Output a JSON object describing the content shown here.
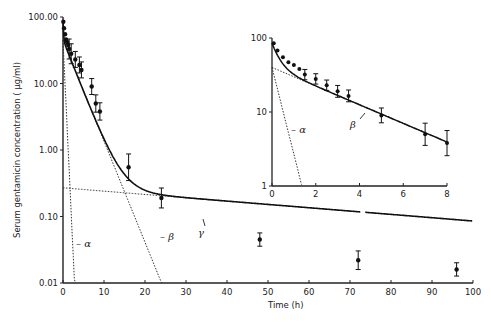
{
  "chart_data": [
    {
      "id": "main",
      "type": "scatter",
      "title": "",
      "xlabel": "Time (h)",
      "ylabel": "Serum gentamicin concentration (µg/ml)",
      "xlim": [
        0,
        100
      ],
      "ylim": [
        0.01,
        100
      ],
      "yscale": "log",
      "xticks": [
        0,
        10,
        20,
        30,
        40,
        50,
        60,
        70,
        80,
        90,
        100
      ],
      "yticks": [
        {
          "v": 100,
          "label": "100.00"
        },
        {
          "v": 10,
          "label": "10.00"
        },
        {
          "v": 1,
          "label": "1.00"
        },
        {
          "v": 0.1,
          "label": "0.10"
        },
        {
          "v": 0.01,
          "label": "0.01"
        }
      ],
      "points": [
        {
          "x": 0.08,
          "y": 85,
          "err": 0
        },
        {
          "x": 0.25,
          "y": 68,
          "err": 0
        },
        {
          "x": 0.5,
          "y": 55,
          "err": 0
        },
        {
          "x": 0.75,
          "y": 46,
          "err": 0
        },
        {
          "x": 1.0,
          "y": 42,
          "err": 0
        },
        {
          "x": 1.25,
          "y": 38,
          "err": 0
        },
        {
          "x": 1.5,
          "y": 33,
          "err": 0.15
        },
        {
          "x": 2.0,
          "y": 28,
          "err": 0.15
        },
        {
          "x": 3.0,
          "y": 23,
          "err": 0.12
        },
        {
          "x": 4.0,
          "y": 19,
          "err": 0.12
        },
        {
          "x": 4.5,
          "y": 16,
          "err": 0.12
        },
        {
          "x": 7.0,
          "y": 9.0,
          "err": 0.12
        },
        {
          "x": 8.0,
          "y": 5.0,
          "err": 0.13
        },
        {
          "x": 9.0,
          "y": 3.8,
          "err": 0.13
        },
        {
          "x": 16,
          "y": 0.55,
          "err": 0.2
        },
        {
          "x": 24,
          "y": 0.19,
          "err": 0.15
        },
        {
          "x": 48,
          "y": 0.045,
          "err": 0.1
        },
        {
          "x": 72,
          "y": 0.022,
          "err": 0.14
        },
        {
          "x": 96,
          "y": 0.016,
          "err": 0.1
        }
      ],
      "fit_curve": {
        "A": 45,
        "alpha": 8.0,
        "B": 45,
        "beta": 0.36,
        "C": 0.27,
        "gamma": 0.0115
      },
      "components": [
        {
          "name": "alpha",
          "label": "α",
          "intercept": 45,
          "rate": 3.0,
          "style": "dotted"
        },
        {
          "name": "beta",
          "label": "β",
          "intercept": 45,
          "rate": 0.35,
          "style": "dotted"
        },
        {
          "name": "gamma",
          "label": "γ",
          "intercept": 0.27,
          "rate": 0.0115,
          "style": "dotted"
        }
      ],
      "annotations": [
        "α",
        "β",
        "γ"
      ]
    },
    {
      "id": "inset",
      "type": "scatter",
      "xlabel": "",
      "ylabel": "",
      "xlim": [
        0,
        8
      ],
      "ylim": [
        1,
        100
      ],
      "yscale": "log",
      "xticks": [
        0,
        2,
        4,
        6,
        8
      ],
      "yticks": [
        {
          "v": 100,
          "label": "100"
        },
        {
          "v": 10,
          "label": "10"
        },
        {
          "v": 1,
          "label": "1"
        }
      ],
      "points": [
        {
          "x": 0.08,
          "y": 85,
          "err": 0
        },
        {
          "x": 0.25,
          "y": 68,
          "err": 0
        },
        {
          "x": 0.5,
          "y": 55,
          "err": 0
        },
        {
          "x": 0.75,
          "y": 47,
          "err": 0
        },
        {
          "x": 1.0,
          "y": 43,
          "err": 0
        },
        {
          "x": 1.25,
          "y": 38,
          "err": 0
        },
        {
          "x": 1.5,
          "y": 32,
          "err": 0.07
        },
        {
          "x": 2.0,
          "y": 28,
          "err": 0.07
        },
        {
          "x": 2.5,
          "y": 23,
          "err": 0.07
        },
        {
          "x": 3.0,
          "y": 19,
          "err": 0.08
        },
        {
          "x": 3.5,
          "y": 16.5,
          "err": 0.08
        },
        {
          "x": 5.0,
          "y": 9.0,
          "err": 0.1
        },
        {
          "x": 7.0,
          "y": 5.0,
          "err": 0.15
        },
        {
          "x": 8.0,
          "y": 3.8,
          "err": 0.17
        }
      ],
      "annotations": [
        "α",
        "β"
      ]
    }
  ],
  "labels": {
    "xlabel": "Time (h)",
    "ylabel": "Serum gentamicin concentration ( µg/ml)",
    "alpha": "α",
    "beta": "β",
    "gamma": "γ"
  }
}
